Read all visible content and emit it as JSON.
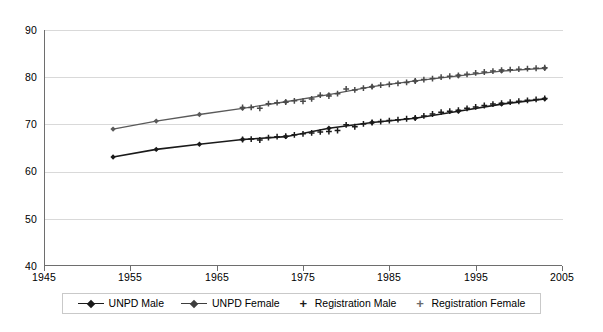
{
  "chart_data": {
    "type": "line",
    "title": "",
    "subtitle": "",
    "xlabel": "",
    "ylabel": "",
    "xlim": [
      1945,
      2005
    ],
    "ylim": [
      40,
      90
    ],
    "xticks": [
      1945,
      1955,
      1965,
      1975,
      1985,
      1995,
      2005
    ],
    "yticks": [
      40,
      50,
      60,
      70,
      80,
      90
    ],
    "grid": "horizontal",
    "legend_position": "bottom",
    "series": [
      {
        "name": "UNPD Male",
        "marker": "diamond",
        "color": "#1a1a1a",
        "linewidth": 1.6,
        "x": [
          1953,
          1958,
          1963,
          1968,
          1973,
          1978,
          1983,
          1988,
          1993,
          1998,
          2003
        ],
        "values": [
          63.1,
          64.7,
          65.8,
          66.8,
          67.4,
          69.2,
          70.4,
          71.3,
          72.8,
          74.3,
          75.4
        ]
      },
      {
        "name": "UNPD Female",
        "marker": "diamond",
        "color": "#5a5a5a",
        "linewidth": 1.3,
        "x": [
          1953,
          1958,
          1963,
          1968,
          1973,
          1978,
          1983,
          1988,
          1993,
          1998,
          2003
        ],
        "values": [
          69.0,
          70.7,
          72.1,
          73.4,
          74.8,
          76.3,
          78.0,
          79.2,
          80.3,
          81.3,
          81.9
        ]
      },
      {
        "name": "Registration Male",
        "marker": "plus",
        "color": "#1a1a1a",
        "linewidth": 0,
        "x": [
          1968,
          1969,
          1970,
          1971,
          1972,
          1973,
          1974,
          1975,
          1976,
          1977,
          1978,
          1979,
          1980,
          1981,
          1982,
          1983,
          1984,
          1985,
          1986,
          1987,
          1988,
          1989,
          1990,
          1991,
          1992,
          1993,
          1994,
          1995,
          1996,
          1997,
          1998,
          1999,
          2000,
          2001,
          2002,
          2003
        ],
        "values": [
          66.8,
          66.9,
          66.7,
          67.2,
          67.4,
          67.5,
          67.8,
          68.0,
          68.2,
          68.4,
          68.5,
          68.7,
          69.9,
          69.5,
          70.1,
          70.4,
          70.6,
          70.8,
          71.0,
          71.2,
          71.4,
          71.8,
          72.2,
          72.6,
          72.8,
          73.0,
          73.4,
          73.7,
          74.0,
          74.3,
          74.5,
          74.7,
          74.9,
          75.1,
          75.3,
          75.5
        ]
      },
      {
        "name": "Registration Female",
        "marker": "plus",
        "color": "#4a4a4a",
        "linewidth": 0,
        "x": [
          1968,
          1969,
          1970,
          1971,
          1972,
          1973,
          1974,
          1975,
          1976,
          1977,
          1978,
          1979,
          1980,
          1981,
          1982,
          1983,
          1984,
          1985,
          1986,
          1987,
          1988,
          1989,
          1990,
          1991,
          1992,
          1993,
          1994,
          1995,
          1996,
          1997,
          1998,
          1999,
          2000,
          2001,
          2002,
          2003
        ],
        "values": [
          73.6,
          73.6,
          73.4,
          74.4,
          74.6,
          74.7,
          75.0,
          74.9,
          75.4,
          76.2,
          76.0,
          76.5,
          77.5,
          77.3,
          77.7,
          78.0,
          78.3,
          78.5,
          78.7,
          78.9,
          79.2,
          79.5,
          79.7,
          80.0,
          80.2,
          80.4,
          80.6,
          80.9,
          81.1,
          81.3,
          81.5,
          81.6,
          81.7,
          81.8,
          81.9,
          82.0
        ]
      }
    ]
  },
  "axes": {
    "y_tick_labels": [
      "90",
      "80",
      "70",
      "60",
      "50",
      "40"
    ],
    "x_tick_labels": [
      "1945",
      "1955",
      "1965",
      "1975",
      "1985",
      "1995",
      "2005"
    ]
  },
  "legend": {
    "entries": [
      {
        "label": "UNPD Male",
        "marker": "diamond-line",
        "color": "#1a1a1a"
      },
      {
        "label": "UNPD Female",
        "marker": "diamond-line",
        "color": "#5a5a5a"
      },
      {
        "label": "Registration Male",
        "marker": "plus",
        "color": "#1a1a1a"
      },
      {
        "label": "Registration Female",
        "marker": "plus",
        "color": "#6a6a6a"
      }
    ],
    "plus_glyph": "+"
  },
  "colors": {
    "grid": "#d9d9d9",
    "axis": "#6e6e6e",
    "background": "#ffffff"
  }
}
